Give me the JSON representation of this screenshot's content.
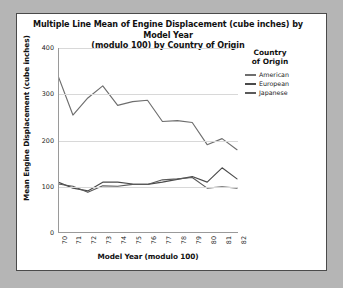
{
  "chart_title": "Multiple Line Mean of Engine Displacement (cube inches) by Model Year (modulo 100) by Country of Origin",
  "chart_title_line1": "Multiple Line Mean of Engine Displacement (cube inches) by Model Year",
  "chart_title_line2": "(modulo 100) by Country of Origin",
  "legend": {
    "title_line1": "Country",
    "title_line2": "of Origin",
    "items": [
      {
        "label": "American",
        "color": "#6e6e6e"
      },
      {
        "label": "European",
        "color": "#4a4a4a"
      },
      {
        "label": "Japanese",
        "color": "#5a5a5a"
      }
    ]
  },
  "axes": {
    "x_title": "Model Year (modulo 100)",
    "y_title": "Mean Engine Displacement (cube inches)",
    "y_ticks": [
      "0",
      "100",
      "200",
      "300",
      "400"
    ],
    "x_ticks": [
      "70",
      "71",
      "72",
      "73",
      "74",
      "75",
      "76",
      "77",
      "78",
      "79",
      "80",
      "81",
      "82"
    ]
  },
  "chart_data": {
    "type": "line",
    "title": "Multiple Line Mean of Engine Displacement (cube inches) by Model Year (modulo 100) by Country of Origin",
    "xlabel": "Model Year (modulo 100)",
    "ylabel": "Mean Engine Displacement (cube inches)",
    "x": [
      70,
      71,
      72,
      73,
      74,
      75,
      76,
      77,
      78,
      79,
      80,
      81,
      82
    ],
    "categories": [
      "70",
      "71",
      "72",
      "73",
      "74",
      "75",
      "76",
      "77",
      "78",
      "79",
      "80",
      "81",
      "82"
    ],
    "xlim": [
      70,
      82
    ],
    "ylim": [
      0,
      400
    ],
    "y_ticks": [
      0,
      100,
      200,
      300,
      400
    ],
    "grid": true,
    "legend_position": "right",
    "series": [
      {
        "name": "American",
        "color": "#6e6e6e",
        "values": [
          340,
          255,
          292,
          318,
          276,
          284,
          287,
          241,
          243,
          239,
          191,
          204,
          180
        ]
      },
      {
        "name": "European",
        "color": "#4a4a4a",
        "values": [
          110,
          97,
          91,
          110,
          110,
          106,
          105,
          110,
          116,
          122,
          110,
          141,
          117
        ]
      },
      {
        "name": "Japanese",
        "color": "#5a5a5a",
        "values": [
          106,
          101,
          88,
          102,
          101,
          105,
          105,
          115,
          117,
          120,
          97,
          100,
          97
        ]
      }
    ]
  }
}
